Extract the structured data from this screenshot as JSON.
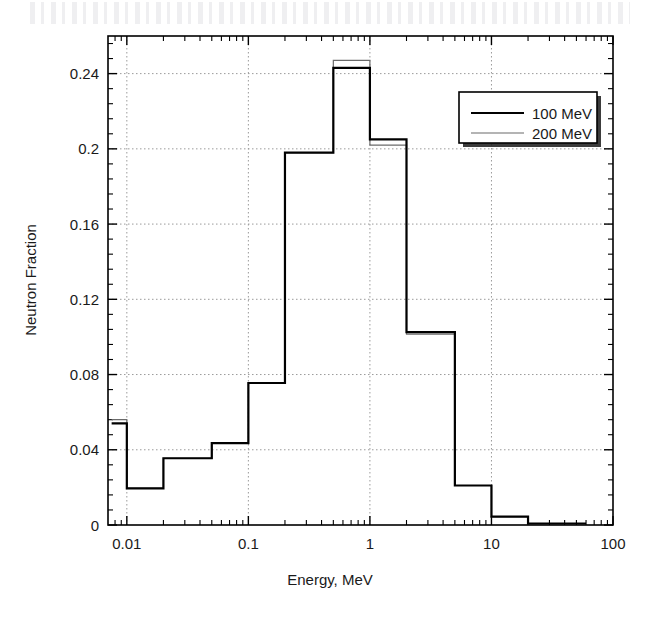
{
  "figure": {
    "background_color": "#ffffff",
    "frame_color": "#000000",
    "grid_color": "#9a9a9a"
  },
  "chart_data": {
    "type": "line",
    "title": "",
    "subtitle": "",
    "xlabel": "Energy, MeV",
    "ylabel": "Neutron Fraction",
    "xscale": "log",
    "yscale": "linear",
    "xlim": [
      0.007,
      100
    ],
    "ylim": [
      0,
      0.26
    ],
    "grid": true,
    "grid_style": "dotted",
    "legend_position": "upper-right",
    "xticks": [
      0.01,
      0.1,
      1,
      10,
      100
    ],
    "xtick_labels": [
      "0.01",
      "0.1",
      "1",
      "10",
      "100"
    ],
    "yticks": [
      0,
      0.04,
      0.08,
      0.12,
      0.16,
      0.2,
      0.24
    ],
    "ytick_labels": [
      "0",
      "0.04",
      "0.08",
      "0.12",
      "0.16",
      "0.2",
      "0.24"
    ],
    "bin_edges": [
      0.0075,
      0.01,
      0.02,
      0.05,
      0.1,
      0.2,
      0.5,
      1,
      2,
      5,
      10,
      20,
      60
    ],
    "series": [
      {
        "name": "100 MeV",
        "color": "#000000",
        "line_width": 2.2,
        "values": [
          0.054,
          0.0195,
          0.0355,
          0.0435,
          0.0755,
          0.198,
          0.243,
          0.205,
          0.1025,
          0.021,
          0.0045,
          0.0008
        ]
      },
      {
        "name": "200 MeV",
        "color": "#6b6b6b",
        "line_width": 1.2,
        "values": [
          0.056,
          0.0195,
          0.0355,
          0.0435,
          0.0755,
          0.198,
          0.247,
          0.202,
          0.1015,
          0.021,
          0.0045,
          0.0008
        ]
      }
    ],
    "legend": [
      {
        "label": "100 MeV",
        "color": "#000000",
        "line_width": 2.2
      },
      {
        "label": "200 MeV",
        "color": "#6b6b6b",
        "line_width": 1.2
      }
    ]
  }
}
